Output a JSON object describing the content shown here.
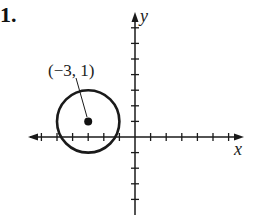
{
  "problem": {
    "number": "1."
  },
  "chart_data": {
    "type": "scatter",
    "title": "",
    "xlabel": "x",
    "ylabel": "y",
    "xlim": [
      -6.5,
      6.8
    ],
    "ylim": [
      -5,
      8.5
    ],
    "grid": false,
    "x_ticks": [
      -6,
      -5,
      -4,
      -3,
      -2,
      -1,
      1,
      2,
      3,
      4,
      5,
      6
    ],
    "y_ticks": [
      -5,
      -4,
      -3,
      -2,
      -1,
      1,
      2,
      3,
      4,
      5,
      6,
      7
    ],
    "series": [
      {
        "name": "circle",
        "shape": "circle",
        "center": [
          -3,
          1
        ],
        "radius": 2
      },
      {
        "name": "center point",
        "points": [
          [
            -3,
            1
          ]
        ]
      }
    ],
    "annotations": [
      {
        "text": "(−3, 1)",
        "points_to": [
          -3,
          1
        ]
      }
    ]
  },
  "labels": {
    "center": "(−3, 1)",
    "x_axis": "x",
    "y_axis": "y"
  },
  "colors": {
    "ink": "#1a1a1a",
    "background": "#ffffff"
  }
}
